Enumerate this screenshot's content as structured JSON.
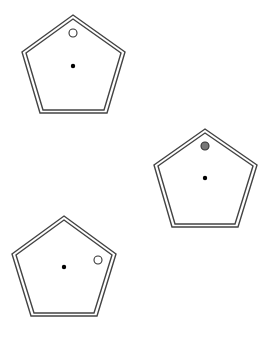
{
  "diagram": {
    "width": 272,
    "height": 339,
    "background": "#ffffff",
    "stroke_color": "#444444",
    "pentagons": [
      {
        "id": "pentagon-1",
        "points": "73,15 125,52 107,113 40,113 22,52",
        "inner_points": "73,19 121,53 104,110 43,110 26,53",
        "center": [
          73,
          66
        ],
        "marker": {
          "type": "open-circle",
          "cx": 73,
          "cy": 33,
          "r": 4,
          "fill": "#ffffff"
        }
      },
      {
        "id": "pentagon-2",
        "points": "205,129 257,165 238,227 172,227 154,165",
        "inner_points": "205,133 253,166 235,224 175,224 158,166",
        "center": [
          205,
          178
        ],
        "marker": {
          "type": "filled-circle",
          "cx": 205,
          "cy": 146,
          "r": 4,
          "fill": "#777777"
        }
      },
      {
        "id": "pentagon-3",
        "points": "64,216 116,254 97,316 31,316 12,254",
        "inner_points": "64,220 112,255 94,313 34,313 16,255",
        "center": [
          64,
          267
        ],
        "marker": {
          "type": "open-circle",
          "cx": 98,
          "cy": 260,
          "r": 4,
          "fill": "#ffffff"
        }
      }
    ]
  }
}
